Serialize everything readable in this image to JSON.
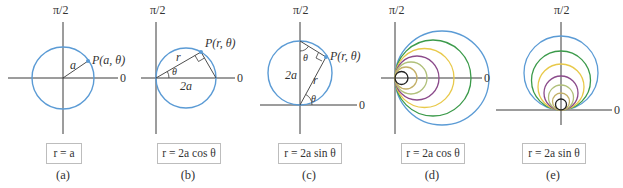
{
  "colors": {
    "axis": "#3a3a3a",
    "primary_circle": "#5b9bd5",
    "families": [
      "#222222",
      "#c4b068",
      "#b0c07a",
      "#8b4b8b",
      "#e8c94a",
      "#3b9a4a",
      "#5b9bd5"
    ]
  },
  "axis_labels": {
    "polar_axis": "0",
    "vertical_axis": "π/2"
  },
  "panels": [
    {
      "id": "a",
      "caption": "(a)",
      "equation": "r = a",
      "labels": {
        "point": "P(a, θ)",
        "radius": "a"
      }
    },
    {
      "id": "b",
      "caption": "(b)",
      "equation": "r = 2a cos θ",
      "labels": {
        "point": "P(r, θ)",
        "radius": "r",
        "angle": "θ",
        "diameter": "2a"
      }
    },
    {
      "id": "c",
      "caption": "(c)",
      "equation": "r = 2a sin θ",
      "labels": {
        "point": "P(r, θ)",
        "radius": "r",
        "angle": "θ",
        "angle_top": "θ",
        "diameter": "2a"
      }
    },
    {
      "id": "d",
      "caption": "(d)",
      "equation": "r = 2a cos θ"
    },
    {
      "id": "e",
      "caption": "(e)",
      "equation": "r = 2a sin θ"
    }
  ]
}
